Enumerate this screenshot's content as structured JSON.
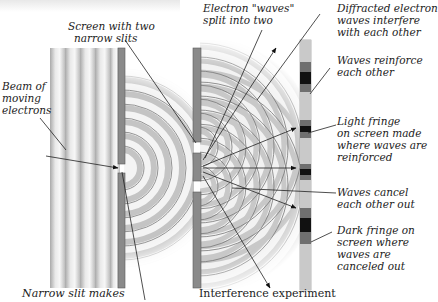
{
  "figure": {
    "caption_right": "Interference experiment",
    "caption_left": "Narrow slit makes"
  },
  "labels": {
    "beam": [
      "Beam of",
      "moving",
      "electrons"
    ],
    "screen_slits": [
      "Screen with two",
      "narrow slits"
    ],
    "waves_split": [
      "Electron \"waves\"",
      "split into two"
    ],
    "diffracted": [
      "Diffracted electron",
      "waves interfere",
      "with each other"
    ],
    "reinforce": [
      "Waves reinforce",
      "each other"
    ],
    "light_fringe": [
      "Light fringe",
      "on screen made",
      "where waves are",
      "reinforced"
    ],
    "cancel": [
      "Waves cancel",
      "each other out"
    ],
    "dark_fringe": [
      "Dark fringe on",
      "screen where",
      "waves are",
      "canceled out"
    ]
  },
  "colors": {
    "barrier": "#8a8a8a",
    "barrier_edge": "#5a5a5a",
    "wave_dark": "#b8b8b8",
    "wave_light": "#f2f2f2",
    "fringe_dark": "#111111",
    "fringe_mid": "#6f6f6f",
    "fringe_light": "#c9c9c9",
    "arrow": "#222222"
  },
  "detector_fringes": [
    {
      "y": 40,
      "h": 22,
      "tone": "light"
    },
    {
      "y": 62,
      "h": 10,
      "tone": "mid"
    },
    {
      "y": 72,
      "h": 12,
      "tone": "dark"
    },
    {
      "y": 84,
      "h": 8,
      "tone": "mid"
    },
    {
      "y": 92,
      "h": 28,
      "tone": "light"
    },
    {
      "y": 120,
      "h": 6,
      "tone": "mid"
    },
    {
      "y": 126,
      "h": 6,
      "tone": "dark"
    },
    {
      "y": 132,
      "h": 6,
      "tone": "mid"
    },
    {
      "y": 138,
      "h": 26,
      "tone": "light"
    },
    {
      "y": 164,
      "h": 5,
      "tone": "mid"
    },
    {
      "y": 169,
      "h": 6,
      "tone": "dark"
    },
    {
      "y": 175,
      "h": 5,
      "tone": "mid"
    },
    {
      "y": 180,
      "h": 28,
      "tone": "light"
    },
    {
      "y": 208,
      "h": 10,
      "tone": "mid"
    },
    {
      "y": 218,
      "h": 14,
      "tone": "dark"
    },
    {
      "y": 232,
      "h": 12,
      "tone": "mid"
    },
    {
      "y": 244,
      "h": 46,
      "tone": "light"
    }
  ]
}
